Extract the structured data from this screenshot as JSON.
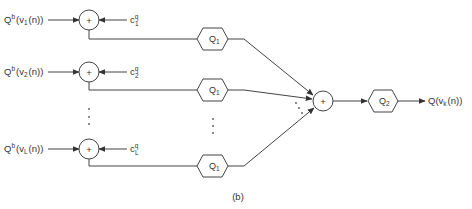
{
  "diagram": {
    "caption": "(b)",
    "inputs": [
      {
        "label_main": "Q",
        "label_sup": "b",
        "label_arg": "(v",
        "label_sub": "1",
        "label_end": "(n))",
        "coef_main": "c",
        "coef_sup": "q",
        "coef_sub": "1"
      },
      {
        "label_main": "Q",
        "label_sup": "b",
        "label_arg": "(v",
        "label_sub": "2",
        "label_end": "(n))",
        "coef_main": "c",
        "coef_sup": "q",
        "coef_sub": "2"
      },
      {
        "label_main": "Q",
        "label_sup": "b",
        "label_arg": "(v",
        "label_sub": "L",
        "label_end": "(n))",
        "coef_main": "c",
        "coef_sup": "q",
        "coef_sub": "L"
      }
    ],
    "adder_symbol": "+",
    "stage1_block": {
      "main": "Q",
      "sub": "1"
    },
    "stage2_block": {
      "main": "Q",
      "sub": "2"
    },
    "output": {
      "main": "Q(v",
      "sub": "k",
      "end": "(n))"
    }
  }
}
